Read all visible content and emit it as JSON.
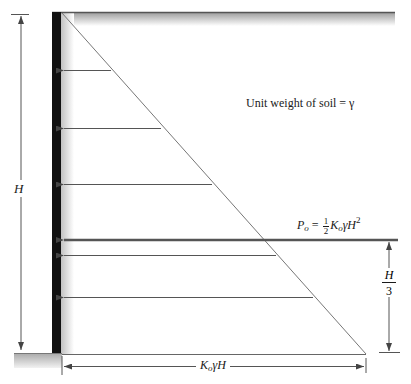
{
  "diagram": {
    "type": "at-rest earth pressure distribution on retaining wall",
    "labels": {
      "unit_weight": "Unit weight of soil = γ",
      "height": "H",
      "resultant": {
        "symbol": "P",
        "symbol_sub": "o",
        "equals": " = ",
        "frac_num": "1",
        "frac_den": "2",
        "coef": "K",
        "coef_sub": "o",
        "rest": "γH",
        "exp": "2"
      },
      "lever_arm": {
        "num": "H",
        "den": "3"
      },
      "base_pressure": {
        "coef": "K",
        "coef_sub": "o",
        "rest": "γH"
      }
    },
    "colors": {
      "wall": "#111111",
      "lines": "#555555",
      "resultant_line": "#555555",
      "ground_shade": "#b8b8b8"
    }
  }
}
